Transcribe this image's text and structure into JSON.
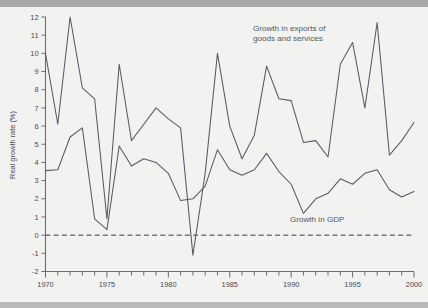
{
  "figure": {
    "background_color": "#f2f2f0",
    "line_color": "#575a66",
    "axis_color": "#6b6b70"
  },
  "annotations": {
    "exports_label_line1": "Growth in exports of",
    "exports_label_line2": "goods and services",
    "gdp_label": "Growth in GDP",
    "ylabel": "Real growth rate (%)"
  },
  "axes": {
    "y_ticks": [
      "12",
      "11",
      "10",
      "9",
      "8",
      "7",
      "6",
      "5",
      "4",
      "3",
      "2",
      "1",
      "0",
      "-1",
      "-2"
    ],
    "x_ticks_labeled": [
      "1970",
      "1975",
      "1980",
      "1985",
      "1990",
      "1995",
      "2000"
    ]
  },
  "chart_data": {
    "type": "line",
    "title": "",
    "xlabel": "",
    "ylabel": "Real growth rate (%)",
    "xlim": [
      1970,
      2000
    ],
    "ylim": [
      -2,
      12
    ],
    "ytick_step": 1,
    "xtick_minor_step": 1,
    "xtick_major_step": 5,
    "grid": false,
    "legend_position": "inline-annotations",
    "reference_lines": [
      {
        "type": "horizontal",
        "value": 0,
        "style": "dashed"
      }
    ],
    "x": [
      1970,
      1971,
      1972,
      1973,
      1974,
      1975,
      1976,
      1977,
      1978,
      1979,
      1980,
      1981,
      1982,
      1983,
      1984,
      1985,
      1986,
      1987,
      1988,
      1989,
      1990,
      1991,
      1992,
      1993,
      1994,
      1995,
      1996,
      1997,
      1998,
      1999,
      2000
    ],
    "series": [
      {
        "name": "Growth in exports of goods and services",
        "values": [
          10.0,
          6.1,
          12.0,
          8.1,
          7.5,
          0.9,
          9.4,
          5.2,
          6.1,
          7.0,
          6.4,
          5.9,
          -1.1,
          3.4,
          10.0,
          6.0,
          4.2,
          5.5,
          9.3,
          7.5,
          7.4,
          5.1,
          5.2,
          4.3,
          9.4,
          10.6,
          7.0,
          11.7,
          4.4,
          5.2,
          6.2
        ]
      },
      {
        "name": "Growth in GDP",
        "values": [
          3.55,
          3.6,
          5.4,
          5.9,
          0.9,
          0.3,
          4.9,
          3.8,
          4.2,
          4.0,
          3.4,
          1.9,
          2.0,
          2.7,
          4.7,
          3.6,
          3.3,
          3.6,
          4.5,
          3.5,
          2.8,
          1.2,
          2.0,
          2.3,
          3.1,
          2.8,
          3.4,
          3.6,
          2.5,
          2.1,
          2.4
        ]
      }
    ]
  }
}
